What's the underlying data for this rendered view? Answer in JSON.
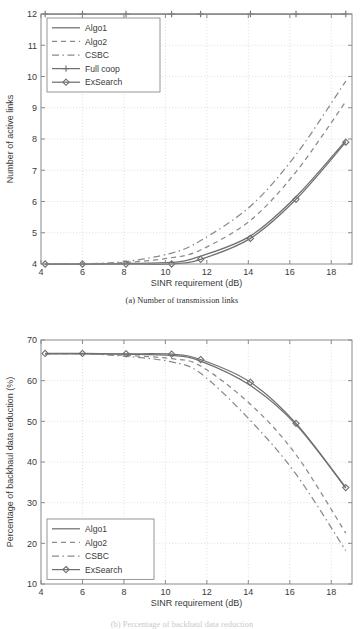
{
  "figure_a": {
    "caption": "(a)  Number of transmission links",
    "legend_entries": [
      "Algo1",
      "Algo2",
      "CSBC",
      "Full coop",
      "ExSearch"
    ]
  },
  "figure_b": {
    "caption": "(b)  Percentage of backhaul data reduction",
    "legend_entries": [
      "Algo1",
      "Algo2",
      "CSBC",
      "ExSearch"
    ]
  },
  "colors": {
    "line": "#6f6f6f",
    "dash": "#8a8a8a",
    "grid": "#cfcfcf",
    "axis": "#8a8a8a",
    "text": "#3a3a3a",
    "background": "#ffffff"
  },
  "chart_data": [
    {
      "type": "line",
      "title": "",
      "caption": "(a)  Number of transmission links",
      "xlabel": "SINR requirement (dB)",
      "ylabel": "Number of active links",
      "xlim": [
        4,
        19
      ],
      "ylim": [
        4,
        12
      ],
      "xticks": [
        4,
        6,
        8,
        10,
        12,
        14,
        16,
        18
      ],
      "yticks": [
        4,
        5,
        6,
        7,
        8,
        9,
        10,
        11,
        12
      ],
      "grid": true,
      "legend_position": "upper-left",
      "x": [
        4.2,
        6.0,
        8.1,
        10.3,
        11.7,
        14.1,
        16.3,
        18.7
      ],
      "series": [
        {
          "name": "Algo1",
          "style": "solid",
          "marker": "none",
          "values": [
            4.0,
            4.0,
            4.02,
            4.05,
            4.25,
            4.9,
            6.15,
            7.95
          ]
        },
        {
          "name": "Algo2",
          "style": "dashed",
          "marker": "none",
          "values": [
            4.0,
            4.0,
            4.05,
            4.2,
            4.45,
            5.4,
            6.95,
            9.2
          ]
        },
        {
          "name": "CSBC",
          "style": "dash-dot",
          "marker": "none",
          "values": [
            4.0,
            4.0,
            4.08,
            4.35,
            4.75,
            5.85,
            7.5,
            9.85
          ]
        },
        {
          "name": "Full coop",
          "style": "solid",
          "marker": "plus",
          "values": [
            12,
            12,
            12,
            12,
            12,
            12,
            12,
            12
          ]
        },
        {
          "name": "ExSearch",
          "style": "solid",
          "marker": "diamond",
          "values": [
            4.0,
            4.0,
            4.0,
            4.0,
            4.15,
            4.82,
            6.07,
            7.9
          ]
        }
      ]
    },
    {
      "type": "line",
      "title": "",
      "caption": "(b)  Percentage of backhaul data reduction",
      "xlabel": "SINR requirement (dB)",
      "ylabel": "Percentage of backhaul data reduction (%)",
      "xlim": [
        4,
        19
      ],
      "ylim": [
        10,
        70
      ],
      "xticks": [
        4,
        6,
        8,
        10,
        12,
        14,
        16,
        18
      ],
      "yticks": [
        10,
        20,
        30,
        40,
        50,
        60,
        70
      ],
      "grid": true,
      "legend_position": "lower-left",
      "x": [
        4.2,
        6.0,
        8.1,
        10.3,
        11.7,
        14.1,
        16.3,
        18.7
      ],
      "series": [
        {
          "name": "Algo1",
          "style": "solid",
          "marker": "none",
          "values": [
            66.6,
            66.6,
            66.5,
            66.2,
            64.8,
            58.8,
            49.2,
            33.6
          ]
        },
        {
          "name": "Algo2",
          "style": "dashed",
          "marker": "none",
          "values": [
            66.6,
            66.6,
            66.2,
            65.4,
            63.6,
            54.2,
            41.8,
            22.5
          ]
        },
        {
          "name": "CSBC",
          "style": "dash-dot",
          "marker": "none",
          "values": [
            66.6,
            66.6,
            66.0,
            64.6,
            61.8,
            50.2,
            37.0,
            18.2
          ]
        },
        {
          "name": "ExSearch",
          "style": "solid",
          "marker": "diamond",
          "values": [
            66.7,
            66.7,
            66.6,
            66.5,
            65.2,
            59.6,
            49.5,
            33.7
          ]
        }
      ]
    }
  ]
}
